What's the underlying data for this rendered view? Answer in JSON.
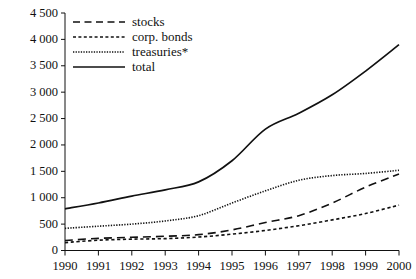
{
  "chart_data": {
    "type": "line",
    "title": "",
    "subtitle": "",
    "xlabel": "",
    "ylabel": "",
    "x": [
      1990,
      1991,
      1992,
      1993,
      1994,
      1995,
      1996,
      1997,
      1998,
      1999,
      2000
    ],
    "categories": [
      "1990",
      "1991",
      "1992",
      "1993",
      "1994",
      "1995",
      "1996",
      "1997",
      "1998",
      "1999",
      "2000"
    ],
    "xlim": [
      1990,
      2000
    ],
    "ylim": [
      0,
      4500
    ],
    "ytick_values": [
      0,
      500,
      1000,
      1500,
      2000,
      2500,
      3000,
      3500,
      4000,
      4500
    ],
    "ytick_labels": [
      "0",
      "500",
      "1 000",
      "1 500",
      "2 000",
      "2 500",
      "3 000",
      "3 500",
      "4 000",
      "4 500"
    ],
    "grid": false,
    "legend_position": "top-left",
    "series": [
      {
        "name": "stocks",
        "style": "dashed",
        "color": "#111111",
        "values": [
          190,
          230,
          250,
          270,
          300,
          390,
          530,
          660,
          900,
          1200,
          1450
        ]
      },
      {
        "name": "corp. bonds",
        "style": "dashed-short",
        "color": "#111111",
        "values": [
          150,
          195,
          215,
          225,
          255,
          310,
          380,
          470,
          580,
          700,
          860
        ]
      },
      {
        "name": "treasuries*",
        "style": "dotted",
        "color": "#111111",
        "values": [
          420,
          460,
          500,
          560,
          660,
          900,
          1130,
          1330,
          1420,
          1460,
          1520
        ]
      },
      {
        "name": "total",
        "style": "solid",
        "color": "#111111",
        "values": [
          790,
          900,
          1030,
          1150,
          1300,
          1700,
          2300,
          2600,
          2950,
          3400,
          3900
        ]
      }
    ]
  },
  "legend": {
    "items": [
      {
        "label": "stocks"
      },
      {
        "label": "corp. bonds"
      },
      {
        "label": "treasuries*"
      },
      {
        "label": "total"
      }
    ]
  },
  "axes": {
    "y_labels": [
      "4 500",
      "4 000",
      "3 500",
      "3 000",
      "2 500",
      "2 000",
      "1 500",
      "1 000",
      "500",
      "0"
    ],
    "x_labels": [
      "1990",
      "1991",
      "1992",
      "1993",
      "1994",
      "1995",
      "1996",
      "1997",
      "1998",
      "1999",
      "2000"
    ]
  }
}
